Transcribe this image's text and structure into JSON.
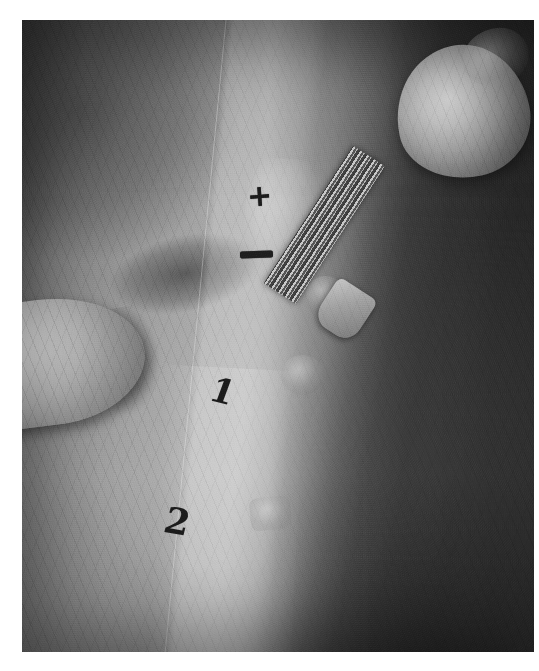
{
  "image": {
    "kind": "clinical-photograph",
    "modality": "grayscale photograph",
    "subject": "skin prick allergy test on volar forearm",
    "caption": "Grayscale clinical photograph showing a skin prick test being performed on the volar aspect of a forearm. Skin-marker annotations label the test sites.",
    "background_color": "#ffffff",
    "frame": {
      "left": 22,
      "top": 20,
      "width": 512,
      "height": 632,
      "border_color": "#ffffff"
    }
  },
  "annotations": {
    "positive_control_label": "+",
    "negative_control_label": "–",
    "site_1_label": "1",
    "site_2_label": "2",
    "ink_color": "#1b1b1b"
  },
  "regions": [
    {
      "name": "operator-fingertip-left",
      "description": "Bright fingertip stretching the skin, entering from the left edge"
    },
    {
      "name": "test-strip-band",
      "description": "Vertical lighter band of skin where the test row is marked"
    },
    {
      "name": "operator-thumb-upper-right",
      "description": "Bright thumb holding the lancet at the upper right"
    },
    {
      "name": "lancet-shaft",
      "description": "Striped diagonal instrument shaft of the prick lancet"
    },
    {
      "name": "lancet-hub",
      "description": "Light wedge-shaped hub at the lower end of the lancet"
    },
    {
      "name": "wheal-a",
      "description": "Small round raised wheal on the shadowed side of the forearm"
    },
    {
      "name": "wheal-b",
      "description": "Second small round wheal lower on the forearm"
    },
    {
      "name": "wheal-c",
      "description": "Faint squarish droplet reaction near the bottom"
    }
  ],
  "palette": {
    "skin_highlight": "#b0b0b0",
    "skin_midtone": "#8d8d8d",
    "skin_shadow": "#4a4a4a",
    "fingertip_highlight": "#e3e3e3",
    "instrument_highlight": "#c9c9c9",
    "ink": "#1b1b1b"
  }
}
